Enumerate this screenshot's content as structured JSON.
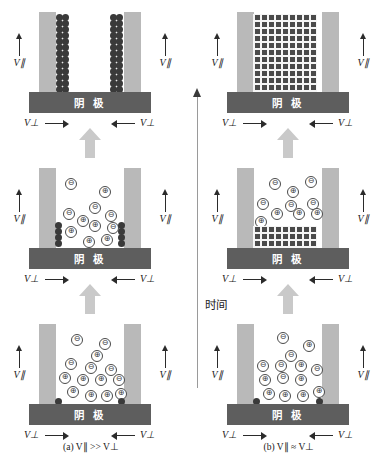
{
  "figure": {
    "time_axis_label": "时间",
    "cathode_label": "阴 极",
    "colors": {
      "wall": "#b9b9b9",
      "cathode": "#5e5e5e",
      "deposit": "#4a4a4a",
      "bulk_arrow": "#c9c9c9",
      "ion_outline": "#4a4a4a",
      "background": "#ffffff"
    },
    "labels": {
      "v_parallel": "V∥",
      "v_perpendicular": "V⊥",
      "cation": "⊕",
      "anion": "⊖"
    }
  },
  "columns": [
    {
      "id": "a",
      "caption_prefix": "(a)",
      "caption_expr": "V∥ >> V⊥",
      "caption_full": "(a) V∥ >> V⊥",
      "stages": [
        {
          "name": "stage-initial",
          "order": 1,
          "description": "Ions dispersed in electrolyte, two small nuclei at wall bases",
          "anions": 7,
          "cations": 9,
          "deposit_type": "nuclei-at-walls"
        },
        {
          "name": "stage-middle",
          "order": 2,
          "description": "Small dendrite seeds grown at both wall bases, ions still in bulk",
          "anions": 5,
          "cations": 8,
          "deposit_type": "small-clusters-at-walls"
        },
        {
          "name": "stage-final",
          "order": 3,
          "description": "Two tall narrow dendrite columns grown along walls to top",
          "anions": 0,
          "cations": 0,
          "deposit_type": "tall-dendrite-columns"
        }
      ]
    },
    {
      "id": "b",
      "caption_prefix": "(b)",
      "caption_expr": "V∥ ≈ V⊥",
      "caption_full": "(b) V∥ ≈ V⊥",
      "stages": [
        {
          "name": "stage-initial",
          "order": 1,
          "description": "Ions dispersed in electrolyte, two small nuclei at wall bases",
          "anions": 7,
          "cations": 9,
          "deposit_type": "nuclei-at-walls"
        },
        {
          "name": "stage-middle",
          "order": 2,
          "description": "Uniform flat deposit layer spanning full gap width",
          "anions": 6,
          "cations": 7,
          "deposit_type": "flat-dense-layer"
        },
        {
          "name": "stage-final",
          "order": 3,
          "description": "Dense uniform block fills entire gap from cathode to top",
          "anions": 0,
          "cations": 0,
          "deposit_type": "full-dense-block"
        }
      ]
    }
  ]
}
